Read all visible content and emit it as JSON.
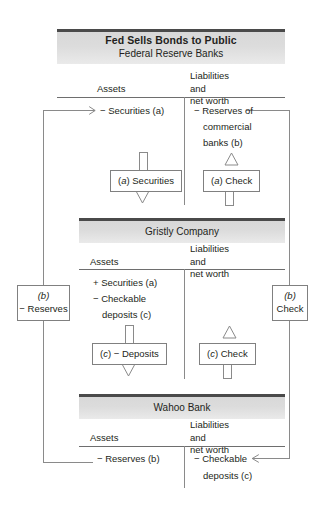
{
  "figure": {
    "title": "Fed Sells Bonds to Public"
  },
  "columns": {
    "assets": "Assets",
    "liabilities_line1": "Liabilities and",
    "liabilities_line2": "net worth"
  },
  "sections": [
    {
      "id": "federal-reserve-banks",
      "name": "Federal Reserve Banks",
      "assets_entries": [
        "− Securities (a)"
      ],
      "liabilities_entries": [
        "− Reserves of",
        "commercial",
        "banks (b)"
      ],
      "assets_box": "(a) Securities",
      "assets_box_arrow": "down",
      "liabilities_box": "(a) Check",
      "liabilities_box_arrow": "up"
    },
    {
      "id": "gristly-company",
      "name": "Gristly Company",
      "assets_entries": [
        "+ Securities (a)",
        "− Checkable",
        "deposits (c)"
      ],
      "liabilities_entries": [],
      "assets_box": "(c) − Deposits",
      "assets_box_arrow": "down",
      "liabilities_box": "(c) Check",
      "liabilities_box_arrow": "up"
    },
    {
      "id": "wahoo-bank",
      "name": "Wahoo Bank",
      "assets_entries": [
        "− Reserves (b)"
      ],
      "liabilities_entries": [
        "− Checkable",
        "deposits (c)"
      ],
      "assets_box": null,
      "liabilities_box": null
    }
  ],
  "side_boxes": {
    "left": {
      "line1": "(b)",
      "line2": "− Reserves"
    },
    "right": {
      "line1": "(b)",
      "line2": "Check"
    }
  },
  "colors": {
    "header_bar": "#4a4a4a",
    "header_fill": "#dcdcdc",
    "rule": "#6e6e6e",
    "line": "#8a8a8a",
    "text": "#231f20"
  }
}
